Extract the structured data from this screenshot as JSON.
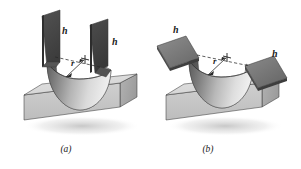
{
  "figure": {
    "background_color": "#ffffff",
    "panels": [
      {
        "id": "a",
        "caption": "(a)",
        "description": "U-shaped channel with two vertical flanges bent around a cylindrical radius over a rectangular block",
        "labels": {
          "height_left": "h",
          "height_right": "h",
          "radius": "r"
        },
        "center_mark": "+",
        "flange_orientation": "vertical"
      },
      {
        "id": "b",
        "caption": "(b)",
        "description": "Hat-shaped channel with two horizontal flanges bent around a cylindrical radius over a rectangular block",
        "labels": {
          "height_left": "h",
          "height_right": "h",
          "radius": "r"
        },
        "center_mark": "+",
        "flange_orientation": "horizontal"
      }
    ],
    "colors": {
      "block_top": "#dcdcdc",
      "block_front": "#c4c4c4",
      "block_side": "#a9a9a9",
      "sheet_dark": "#474747",
      "sheet_mid": "#6e6e6e",
      "sheet_light": "#d2d2d2",
      "outline": "#3a3a3a",
      "label": "#1a1a1a"
    }
  }
}
